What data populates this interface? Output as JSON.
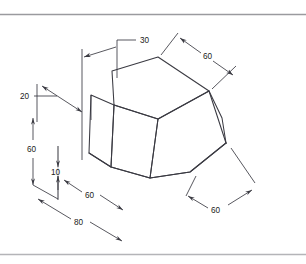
{
  "document": {
    "type": "isometric-technical-drawing",
    "title": "",
    "background_color": "#ffffff",
    "line_color": "#3a3a42",
    "border_color": "#9a9a9e"
  },
  "borders": [
    {
      "name": "top-rule",
      "y": 14
    },
    {
      "name": "bottom-rule",
      "y": 254
    }
  ],
  "dimensions": [
    {
      "id": "d30",
      "label": "30",
      "x": 140,
      "y": 42,
      "name": "dimension-30-top"
    },
    {
      "id": "d60tr",
      "label": "60",
      "x": 208,
      "y": 56,
      "name": "dimension-60-top-right"
    },
    {
      "id": "d20",
      "label": "20",
      "x": 22,
      "y": 100,
      "name": "dimension-20-left"
    },
    {
      "id": "d60l",
      "label": "60",
      "x": 30,
      "y": 150,
      "name": "dimension-60-left-vertical"
    },
    {
      "id": "d10",
      "label": "10",
      "x": 54,
      "y": 172,
      "name": "dimension-10-left-vertical"
    },
    {
      "id": "d60b",
      "label": "60",
      "x": 89,
      "y": 196,
      "name": "dimension-60-bottom-left"
    },
    {
      "id": "d60br",
      "label": "60",
      "x": 216,
      "y": 211,
      "name": "dimension-60-bottom-right"
    },
    {
      "id": "d80",
      "label": "80",
      "x": 78,
      "y": 222,
      "name": "dimension-80-bottom"
    }
  ],
  "solid": {
    "name": "beveled-prism-isometric",
    "top_face": [
      [
        112,
        71
      ],
      [
        158,
        57
      ],
      [
        209,
        91
      ],
      [
        158,
        119
      ],
      [
        114,
        105
      ]
    ],
    "front_face": [
      [
        114,
        105
      ],
      [
        158,
        119
      ],
      [
        150,
        178
      ],
      [
        111,
        167
      ]
    ],
    "right_face": [
      [
        158,
        119
      ],
      [
        209,
        91
      ],
      [
        226,
        143
      ],
      [
        190,
        172
      ],
      [
        150,
        178
      ]
    ],
    "base_outline": [
      [
        89,
        153
      ],
      [
        111,
        167
      ],
      [
        150,
        178
      ],
      [
        190,
        172
      ],
      [
        226,
        143
      ]
    ]
  },
  "accent": {
    "line_color": "#3a3a42",
    "text_color": "#1a1a1a"
  }
}
